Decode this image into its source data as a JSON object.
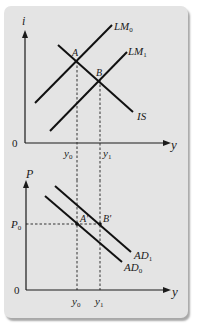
{
  "diagram": {
    "background_color": "#ffffff",
    "card_color": "#e4e4e4",
    "line_color": "#111111",
    "top_panel": {
      "y_axis_label": "i",
      "x_axis_label": "y",
      "origin_label": "0",
      "curves": [
        {
          "name": "LM0",
          "label_main": "LM",
          "label_sub": "0"
        },
        {
          "name": "LM1",
          "label_main": "LM",
          "label_sub": "1"
        },
        {
          "name": "IS",
          "label_main": "IS",
          "label_sub": ""
        }
      ],
      "points": [
        {
          "name": "A",
          "label": "A"
        },
        {
          "name": "B",
          "label": "B"
        }
      ],
      "x_ticks": [
        {
          "main": "y",
          "sub": "0"
        },
        {
          "main": "y",
          "sub": "1"
        }
      ]
    },
    "bottom_panel": {
      "y_axis_label": "P",
      "x_axis_label": "y",
      "origin_label": "0",
      "y_ticks": [
        {
          "main": "P",
          "sub": "0"
        }
      ],
      "curves": [
        {
          "name": "AD1",
          "label_main": "AD",
          "label_sub": "1"
        },
        {
          "name": "AD0",
          "label_main": "AD",
          "label_sub": "0"
        }
      ],
      "points": [
        {
          "name": "A-prime",
          "label": "A'"
        },
        {
          "name": "B-prime",
          "label": "B'"
        }
      ],
      "x_ticks": [
        {
          "main": "y",
          "sub": "0"
        },
        {
          "main": "y",
          "sub": "1"
        }
      ]
    }
  }
}
